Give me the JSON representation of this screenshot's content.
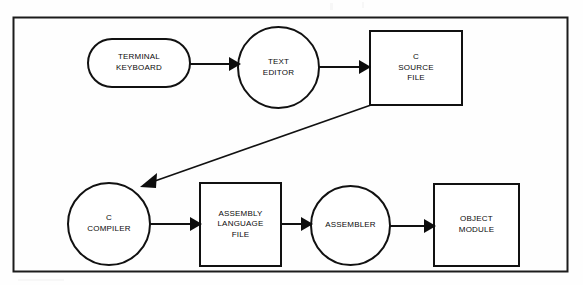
{
  "diagram": {
    "type": "flowchart",
    "frame": {
      "name": "outer-border",
      "x": 13,
      "y": 17,
      "width": 555,
      "height": 255,
      "stroke": "#1a1a1a",
      "stroke_width": 2
    },
    "colors": {
      "background": "#fefefe",
      "stroke": "#111111",
      "text": "#0a0a0a",
      "fill": "#ffffff"
    },
    "nodes": [
      {
        "id": "terminal-keyboard",
        "shape": "stadium",
        "lines": [
          "TERMINAL",
          "KEYBOARD"
        ],
        "x": 88,
        "y": 39,
        "width": 102,
        "height": 48
      },
      {
        "id": "text-editor",
        "shape": "ellipse",
        "lines": [
          "TEXT",
          "EDITOR"
        ],
        "x": 238,
        "y": 27,
        "width": 81,
        "height": 81
      },
      {
        "id": "c-source-file",
        "shape": "rect",
        "lines": [
          "C",
          "SOURCE",
          "FILE"
        ],
        "x": 370,
        "y": 31,
        "width": 92,
        "height": 74
      },
      {
        "id": "c-compiler",
        "shape": "ellipse",
        "lines": [
          "C",
          "COMPILER"
        ],
        "x": 68,
        "y": 183,
        "width": 82,
        "height": 82
      },
      {
        "id": "assembly-language-file",
        "shape": "rect",
        "lines": [
          "ASSEMBLY",
          "LANGUAGE",
          "FILE"
        ],
        "x": 200,
        "y": 183,
        "width": 81,
        "height": 83
      },
      {
        "id": "assembler",
        "shape": "ellipse",
        "lines": [
          "ASSEMBLER"
        ],
        "x": 311,
        "y": 186,
        "width": 79,
        "height": 79
      },
      {
        "id": "object-module",
        "shape": "rect",
        "lines": [
          "OBJECT",
          "MODULE"
        ],
        "x": 434,
        "y": 184,
        "width": 85,
        "height": 82
      }
    ],
    "edges": [
      {
        "id": "edge-keyboard-to-editor",
        "from": "terminal-keyboard",
        "to": "text-editor",
        "direction": "right",
        "points": "190,64 238,64"
      },
      {
        "id": "edge-editor-to-source",
        "from": "text-editor",
        "to": "c-source-file",
        "direction": "right",
        "points": "319,67 370,67"
      },
      {
        "id": "edge-source-to-compiler",
        "from": "c-source-file",
        "to": "c-compiler",
        "direction": "diagonal-down-left",
        "points": "371,105 141,186"
      },
      {
        "id": "edge-compiler-to-asm",
        "from": "c-compiler",
        "to": "assembly-language-file",
        "direction": "right",
        "points": "150,224 200,224"
      },
      {
        "id": "edge-asm-to-assembler",
        "from": "assembly-language-file",
        "to": "assembler",
        "direction": "right",
        "points": "281,224 311,224"
      },
      {
        "id": "edge-assembler-to-object",
        "from": "assembler",
        "to": "object-module",
        "direction": "right",
        "points": "390,226 434,226"
      }
    ]
  }
}
